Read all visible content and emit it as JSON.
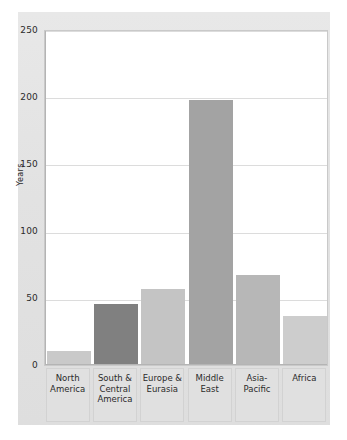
{
  "chart_data": {
    "type": "bar",
    "title": "",
    "subtitle": "",
    "xlabel": "",
    "ylabel": "Years",
    "categories": [
      "North\nAmerica",
      "South &\nCentral\nAmerica",
      "Europe &\nEurasia",
      "Middle\nEast",
      "Asia-\nPacific",
      "Africa"
    ],
    "values": [
      10,
      45,
      56,
      198,
      67,
      36
    ],
    "ylim": [
      0,
      250
    ],
    "yticks": [
      0,
      50,
      100,
      150,
      200,
      250
    ],
    "ytick_labels": [
      "0",
      "50",
      "100",
      "150",
      "200",
      "250"
    ],
    "grid": true,
    "legend": "none",
    "bar_colors": [
      "#c9c9c9",
      "#808080",
      "#c4c4c4",
      "#a3a3a3",
      "#b7b7b7",
      "#cdcdcd"
    ]
  },
  "axis": {
    "y_label": "Years",
    "tick_0": "0",
    "tick_50": "50",
    "tick_100": "100",
    "tick_150": "150",
    "tick_200": "200",
    "tick_250": "250"
  },
  "categories": {
    "c0": "North\nAmerica",
    "c1": "South &\nCentral\nAmerica",
    "c2": "Europe &\nEurasia",
    "c3": "Middle\nEast",
    "c4": "Asia-\nPacific",
    "c5": "Africa"
  },
  "colors": {
    "panel": "#e4e4e4",
    "plot_background": "#ffffff",
    "gridline": "#dcdcdc",
    "axis": "#b4b4b4",
    "text": "#2b2b2b"
  }
}
